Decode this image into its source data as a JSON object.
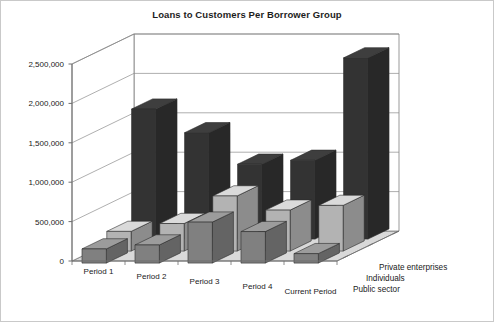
{
  "chart_data": {
    "type": "bar",
    "title": "Loans to Customers Per Borrower Group",
    "subtitle": "",
    "xlabel": "",
    "ylabel": "",
    "zlabel": "",
    "projection": "3d-clustered-column",
    "grid": true,
    "legend_position": "depth-axis-right",
    "categories": [
      "Period 1",
      "Period 2",
      "Period 3",
      "Period 4",
      "Current Period"
    ],
    "ylim": [
      0,
      2500000
    ],
    "ytick_values": [
      0,
      500000,
      1000000,
      1500000,
      2000000,
      2500000
    ],
    "ytick_labels": [
      "0",
      "500,000",
      "1,000,000",
      "1,500,000",
      "2,000,000",
      "2,500,000"
    ],
    "series": [
      {
        "name": "Public sector",
        "depth_index": 0,
        "color": "#808080",
        "values": [
          180000,
          230000,
          520000,
          400000,
          120000
        ]
      },
      {
        "name": "Individuals",
        "depth_index": 1,
        "color": "#b3b3b3",
        "values": [
          250000,
          350000,
          700000,
          520000,
          580000
        ]
      },
      {
        "name": "Private enterprises",
        "depth_index": 2,
        "color": "#333333",
        "values": [
          1650000,
          1350000,
          950000,
          1000000,
          2300000
        ]
      }
    ]
  },
  "colors": {
    "plot_background": "#ffffff",
    "floor": "#d9d9d9",
    "gridline": "#8c8c8c",
    "axis": "#6e6e6e",
    "text": "#1a1a1a",
    "frame_border": "#c9c9c9"
  },
  "depth_axis": {
    "labels": [
      "Private enterprises",
      "Individuals",
      "Public sector"
    ]
  }
}
